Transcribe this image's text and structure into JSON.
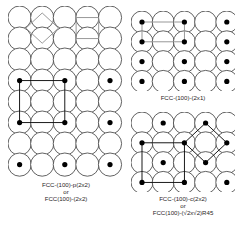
{
  "figure": {
    "background_color": "#ffffff",
    "substrate_circle_stroke": "#3a3a3a",
    "adsorbate_dot_color": "#000000",
    "unit_cell_black": "#000000",
    "unit_cell_gray": "#8d8d8d"
  },
  "panels": [
    {
      "id": "p2x2",
      "name": "fcc-100-p2x2",
      "lattice": {
        "columns": 5,
        "rows": 8,
        "circle_radius": 11.6,
        "spacing_x": 22.6,
        "spacing_y": 21.0,
        "circle_stroke_width": 0.8
      },
      "adsorbates": {
        "description": "p(2x2) overlayer: adsorbate every 2nd column and every 2nd row",
        "columns": [
          1,
          3,
          5
        ],
        "rows": [
          4,
          6,
          8
        ],
        "dot_radius": 2.6
      },
      "overlays": [
        {
          "name": "substrate-unit-cell-square",
          "shape": "square",
          "color": "#8d8d8d",
          "rotation_deg": 0,
          "center_col": 4,
          "center_row": 1.5,
          "size_cells": 1
        },
        {
          "name": "substrate-unit-cell-diamond",
          "shape": "square",
          "color": "#8d8d8d",
          "rotation_deg": 45,
          "center_col": 2,
          "center_row": 1.5,
          "size_cells": 1
        },
        {
          "name": "overlayer-unit-cell-square",
          "shape": "square",
          "color": "#000000",
          "rotation_deg": 0,
          "center_col": 2,
          "center_row": 5,
          "size_cells": 2
        }
      ],
      "caption": {
        "lines": [
          "FCC-(100)-p(2x2)",
          "or",
          "FCC(100)-(2x2)"
        ]
      }
    },
    {
      "id": "2x1",
      "name": "fcc-100-2x1",
      "lattice": {
        "columns": 5,
        "rows": 4,
        "circle_radius": 11.0,
        "spacing_x": 21.2,
        "spacing_y": 19.8,
        "circle_stroke_width": 0.8
      },
      "adsorbates": {
        "description": "(2x1) overlayer: adsorbate every 2nd column, every row",
        "columns": [
          1,
          3,
          5
        ],
        "rows": [
          1,
          2,
          3,
          4
        ],
        "dot_radius": 2.6
      },
      "overlays": [
        {
          "name": "overlayer-unit-cell-rectangle",
          "shape": "rectangle",
          "color": "#8d8d8d",
          "rotation_deg": 0,
          "col_from": 1,
          "col_to": 3,
          "row_from": 1,
          "row_to": 2
        }
      ],
      "caption": {
        "lines": [
          "FCC-(100)-(2x1)"
        ]
      }
    },
    {
      "id": "c2x2",
      "name": "fcc-100-c2x2",
      "lattice": {
        "columns": 5,
        "rows": 4,
        "circle_radius": 11.0,
        "spacing_x": 21.2,
        "spacing_y": 19.8,
        "circle_stroke_width": 0.8
      },
      "adsorbates": {
        "description": "c(2x2) centred overlayer: checkerboard arrangement",
        "pattern": "checkerboard",
        "cells": [
          {
            "col": 2,
            "row": 1
          },
          {
            "col": 4,
            "row": 1
          },
          {
            "col": 1,
            "row": 2
          },
          {
            "col": 3,
            "row": 2
          },
          {
            "col": 5,
            "row": 2
          },
          {
            "col": 2,
            "row": 3
          },
          {
            "col": 4,
            "row": 3
          },
          {
            "col": 1,
            "row": 4
          },
          {
            "col": 3,
            "row": 4
          },
          {
            "col": 5,
            "row": 4
          }
        ],
        "dot_radius": 2.6
      },
      "overlays": [
        {
          "name": "overlayer-unit-cell-square",
          "shape": "square",
          "color": "#000000",
          "rotation_deg": 0,
          "col_from": 1,
          "col_to": 3,
          "row_from": 2,
          "row_to": 4
        },
        {
          "name": "overlayer-unit-cell-diamond-r45",
          "shape": "square",
          "color": "#000000",
          "rotation_deg": 45,
          "center_col": 4,
          "center_row": 2,
          "half_diag_cells": 1
        }
      ],
      "caption": {
        "lines": [
          "FCC-(100)-c(2x2)",
          "or",
          "FCC(100)-(√2x√2)R45"
        ]
      }
    }
  ]
}
